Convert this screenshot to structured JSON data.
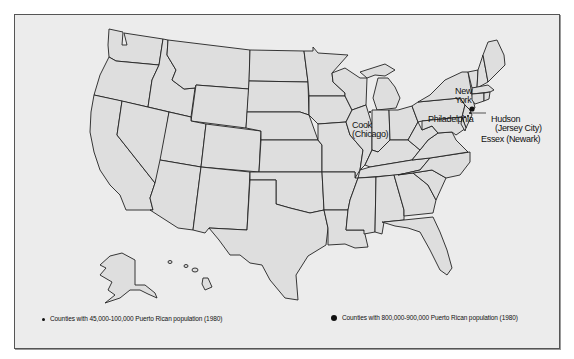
{
  "map": {
    "title": "",
    "region": "United States",
    "labels": {
      "new_york": "New York",
      "new_york_line1": "New",
      "new_york_line2": "York",
      "cook_line1": "Cook",
      "cook_line2": "(Chicago)",
      "philadelphia": "Philadelphia",
      "hudson_line1": "Hudson",
      "hudson_line2": "(Jersey City)",
      "essex": "Essex (Newark)"
    },
    "markers": [
      {
        "name": "New York",
        "size": "large",
        "category": "800,000-900,000"
      },
      {
        "name": "Cook (Chicago)",
        "size": "small",
        "category": "45,000-100,000"
      },
      {
        "name": "Philadelphia",
        "size": "small",
        "category": "45,000-100,000"
      },
      {
        "name": "Hudson (Jersey City)",
        "size": "small",
        "category": "45,000-100,000"
      },
      {
        "name": "Essex (Newark)",
        "size": "small",
        "category": "45,000-100,000"
      }
    ]
  },
  "legend": {
    "small": "Counties with 45,000-100,000 Puerto Rican population (1980)",
    "large": "Counties with 800,000-900,000 Puerto Rican population (1980)"
  },
  "colors": {
    "land": "#dedede",
    "background": "#ececec",
    "border": "#222222"
  }
}
